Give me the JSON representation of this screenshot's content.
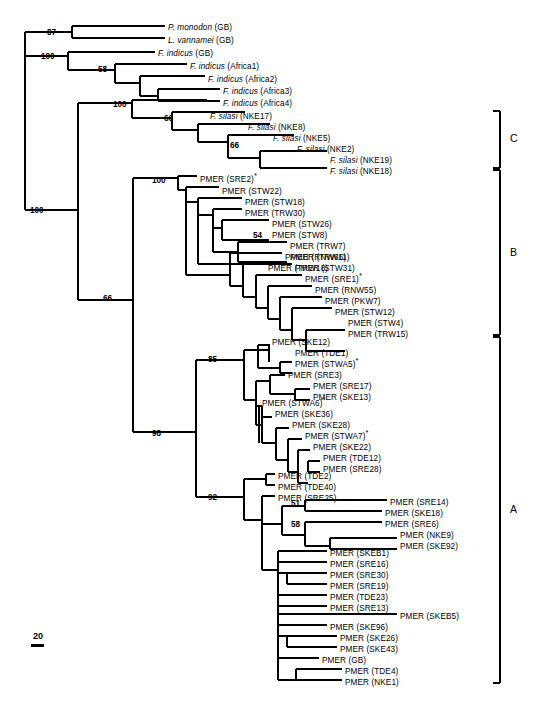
{
  "figure": {
    "kind": "phylogenetic-tree",
    "tree_type": "rectangular-cladogram",
    "scale_bar": {
      "value": "20"
    },
    "asterisk_marker": "*"
  },
  "clade_brackets": [
    {
      "id": "C",
      "label": "C",
      "y_top": 111,
      "y_bottom": 168
    },
    {
      "id": "B",
      "label": "B",
      "y_top": 170,
      "y_bottom": 335
    },
    {
      "id": "A",
      "label": "A",
      "y_top": 337,
      "y_bottom": 683
    }
  ],
  "bootstrap_values": [
    {
      "value": "87",
      "x": 47,
      "y": 29
    },
    {
      "value": "100",
      "x": 41,
      "y": 53
    },
    {
      "value": "58",
      "x": 98,
      "y": 66
    },
    {
      "value": "100",
      "x": 113,
      "y": 101
    },
    {
      "value": "66",
      "x": 164,
      "y": 115
    },
    {
      "value": "66",
      "x": 230,
      "y": 142
    },
    {
      "value": "100",
      "x": 152,
      "y": 177
    },
    {
      "value": "54",
      "x": 253,
      "y": 232
    },
    {
      "value": "100",
      "x": 30,
      "y": 207
    },
    {
      "value": "66",
      "x": 103,
      "y": 295
    },
    {
      "value": "98",
      "x": 152,
      "y": 430
    },
    {
      "value": "85",
      "x": 208,
      "y": 356
    },
    {
      "value": "92",
      "x": 208,
      "y": 494
    },
    {
      "value": "51",
      "x": 291,
      "y": 500
    },
    {
      "value": "58",
      "x": 291,
      "y": 521
    }
  ],
  "taxa": [
    {
      "name": "P. monodon (GB)",
      "genus": "P. monodon",
      "suffix": " (GB)",
      "italic": true,
      "asterisk": false,
      "x": 168,
      "y": 28,
      "tip_x": 165
    },
    {
      "name": "L. vannamei (GB)",
      "genus": "L. vannamei",
      "suffix": " (GB)",
      "italic": true,
      "asterisk": false,
      "x": 168,
      "y": 41,
      "tip_x": 165
    },
    {
      "name": "F. indicus (GB)",
      "genus": "F. indicus",
      "suffix": " (GB)",
      "italic": true,
      "asterisk": false,
      "x": 158,
      "y": 54,
      "tip_x": 155
    },
    {
      "name": "F. indicus (Africa1)",
      "genus": "F. indicus",
      "suffix": " (Africa1)",
      "italic": true,
      "asterisk": false,
      "x": 190,
      "y": 67,
      "tip_x": 187
    },
    {
      "name": "F. indicus (Africa2)",
      "genus": "F. indicus",
      "suffix": " (Africa2)",
      "italic": true,
      "asterisk": false,
      "x": 208,
      "y": 80,
      "tip_x": 205
    },
    {
      "name": "F. indicus (Africa3)",
      "genus": "F. indicus",
      "suffix": " (Africa3)",
      "italic": true,
      "asterisk": false,
      "x": 223,
      "y": 92,
      "tip_x": 220
    },
    {
      "name": "F. indicus (Africa4)",
      "genus": "F. indicus",
      "suffix": " (Africa4)",
      "italic": true,
      "asterisk": false,
      "x": 223,
      "y": 104,
      "tip_x": 220
    },
    {
      "name": "F. silasi (NKE17)",
      "genus": "F. silasi",
      "suffix": " (NKE17)",
      "italic": true,
      "asterisk": false,
      "x": 210,
      "y": 117,
      "tip_x": 207
    },
    {
      "name": "F. silasi (NKE8)",
      "genus": "F. silasi",
      "suffix": " (NKE8)",
      "italic": true,
      "asterisk": false,
      "x": 248,
      "y": 128,
      "tip_x": 245
    },
    {
      "name": "F. silasi (NKE5)",
      "genus": "F. silasi",
      "suffix": " (NKE5)",
      "italic": true,
      "asterisk": false,
      "x": 273,
      "y": 139,
      "tip_x": 270
    },
    {
      "name": "F. silasi (NKE2)",
      "genus": "F. silasi",
      "suffix": " (NKE2)",
      "italic": true,
      "asterisk": false,
      "x": 297,
      "y": 150,
      "tip_x": 294
    },
    {
      "name": "F. silasi (NKE19)",
      "genus": "F. silasi",
      "suffix": " (NKE19)",
      "italic": true,
      "asterisk": false,
      "x": 330,
      "y": 161,
      "tip_x": 327
    },
    {
      "name": "F. silasi (NKE18)",
      "genus": "F. silasi",
      "suffix": " (NKE18)",
      "italic": true,
      "asterisk": false,
      "x": 330,
      "y": 172,
      "tip_x": 327
    },
    {
      "name": "PMER (SRE2)*",
      "genus": "",
      "suffix": "PMER (SRE2)",
      "italic": false,
      "asterisk": true,
      "x": 200,
      "y": 180,
      "tip_x": 197
    },
    {
      "name": "PMER (STW22)",
      "genus": "",
      "suffix": "PMER (STW22)",
      "italic": false,
      "asterisk": false,
      "x": 222,
      "y": 192,
      "tip_x": 219
    },
    {
      "name": "PMER (STW18)",
      "genus": "",
      "suffix": "PMER (STW18)",
      "italic": false,
      "asterisk": false,
      "x": 245,
      "y": 203,
      "tip_x": 242
    },
    {
      "name": "PMER (TRW30)",
      "genus": "",
      "suffix": "PMER (TRW30)",
      "italic": false,
      "asterisk": false,
      "x": 245,
      "y": 214,
      "tip_x": 242
    },
    {
      "name": "PMER (STW26)",
      "genus": "",
      "suffix": "PMER (STW26)",
      "italic": false,
      "asterisk": false,
      "x": 272,
      "y": 225,
      "tip_x": 269
    },
    {
      "name": "PMER (STW8)",
      "genus": "",
      "suffix": "PMER (STW8)",
      "italic": false,
      "asterisk": false,
      "x": 272,
      "y": 236,
      "tip_x": 269
    },
    {
      "name": "PMER (TRW7)",
      "genus": "",
      "suffix": "PMER (TRW7)",
      "italic": false,
      "asterisk": false,
      "x": 290,
      "y": 247,
      "tip_x": 287
    },
    {
      "name": "PMER (TRW11)",
      "genus": "",
      "suffix": "PMER (TRW11)",
      "italic": false,
      "asterisk": false,
      "x": 290,
      "y": 258,
      "tip_x": 287
    },
    {
      "name": "PMER (TRW18)",
      "genus": "",
      "suffix": "PMER (TRW18)",
      "italic": false,
      "asterisk": false,
      "x": 268,
      "y": 269,
      "tip_x": 265
    },
    {
      "name": "PMER (RNW66)",
      "genus": "",
      "suffix": "PMER (RNW66)",
      "italic": false,
      "asterisk": false,
      "x": 285,
      "y": 258,
      "tip_x": 282
    },
    {
      "name": "PMER (STW31)",
      "genus": "",
      "suffix": "PMER (STW31)",
      "italic": false,
      "asterisk": false,
      "x": 295,
      "y": 269,
      "tip_x": 292
    },
    {
      "name": "PMER (SRE1)*",
      "genus": "",
      "suffix": "PMER (SRE1)",
      "italic": false,
      "asterisk": true,
      "x": 305,
      "y": 280,
      "tip_x": 302
    },
    {
      "name": "PMER (RNW55)",
      "genus": "",
      "suffix": "PMER (RNW55)",
      "italic": false,
      "asterisk": false,
      "x": 315,
      "y": 291,
      "tip_x": 312
    },
    {
      "name": "PMER (PKW7)",
      "genus": "",
      "suffix": "PMER (PKW7)",
      "italic": false,
      "asterisk": false,
      "x": 325,
      "y": 302,
      "tip_x": 322
    },
    {
      "name": "PMER (STW12)",
      "genus": "",
      "suffix": "PMER (STW12)",
      "italic": false,
      "asterisk": false,
      "x": 335,
      "y": 313,
      "tip_x": 332
    },
    {
      "name": "PMER (STW4)",
      "genus": "",
      "suffix": "PMER (STW4)",
      "italic": false,
      "asterisk": false,
      "x": 348,
      "y": 324,
      "tip_x": 345
    },
    {
      "name": "PMER (TRW15)",
      "genus": "",
      "suffix": "PMER (TRW15)",
      "italic": false,
      "asterisk": false,
      "x": 348,
      "y": 335,
      "tip_x": 345
    },
    {
      "name": "PMER (SKE12)",
      "genus": "",
      "suffix": "PMER (SKE12)",
      "italic": false,
      "asterisk": false,
      "x": 272,
      "y": 343,
      "tip_x": 269
    },
    {
      "name": "PMER (TDE1)",
      "genus": "",
      "suffix": "PMER (TDE1)",
      "italic": false,
      "asterisk": false,
      "x": 295,
      "y": 354,
      "tip_x": 292
    },
    {
      "name": "PMER (STWA5)*",
      "genus": "",
      "suffix": "PMER (STWA5)",
      "italic": false,
      "asterisk": true,
      "x": 295,
      "y": 365,
      "tip_x": 292
    },
    {
      "name": "PMER (SRE3)",
      "genus": "",
      "suffix": "PMER (SRE3)",
      "italic": false,
      "asterisk": false,
      "x": 288,
      "y": 376,
      "tip_x": 285
    },
    {
      "name": "PMER (SRE17)",
      "genus": "",
      "suffix": "PMER (SRE17)",
      "italic": false,
      "asterisk": false,
      "x": 313,
      "y": 387,
      "tip_x": 310
    },
    {
      "name": "PMER (SKE13)",
      "genus": "",
      "suffix": "PMER (SKE13)",
      "italic": false,
      "asterisk": false,
      "x": 313,
      "y": 398,
      "tip_x": 310
    },
    {
      "name": "PMER (STWA6)*",
      "genus": "",
      "suffix": "PMER (STWA6)",
      "italic": false,
      "asterisk": true,
      "x": 262,
      "y": 404,
      "tip_x": 259
    },
    {
      "name": "PMER (SKE36)",
      "genus": "",
      "suffix": "PMER (SKE36)",
      "italic": false,
      "asterisk": false,
      "x": 275,
      "y": 415,
      "tip_x": 272
    },
    {
      "name": "PMER (SKE28)",
      "genus": "",
      "suffix": "PMER (SKE28)",
      "italic": false,
      "asterisk": false,
      "x": 292,
      "y": 426,
      "tip_x": 289
    },
    {
      "name": "PMER (STWA7)*",
      "genus": "",
      "suffix": "PMER (STWA7)",
      "italic": false,
      "asterisk": true,
      "x": 305,
      "y": 437,
      "tip_x": 302
    },
    {
      "name": "PMER (SKE22)",
      "genus": "",
      "suffix": "PMER (SKE22)",
      "italic": false,
      "asterisk": false,
      "x": 313,
      "y": 448,
      "tip_x": 310
    },
    {
      "name": "PMER (TDE12)",
      "genus": "",
      "suffix": "PMER (TDE12)",
      "italic": false,
      "asterisk": false,
      "x": 323,
      "y": 459,
      "tip_x": 320
    },
    {
      "name": "PMER (SRE28)",
      "genus": "",
      "suffix": "PMER (SRE28)",
      "italic": false,
      "asterisk": false,
      "x": 323,
      "y": 470,
      "tip_x": 320
    },
    {
      "name": "PMER (TDE2)",
      "genus": "",
      "suffix": "PMER (TDE2)",
      "italic": false,
      "asterisk": false,
      "x": 278,
      "y": 477,
      "tip_x": 275
    },
    {
      "name": "PMER (TDE40)",
      "genus": "",
      "suffix": "PMER (TDE40)",
      "italic": false,
      "asterisk": false,
      "x": 278,
      "y": 488,
      "tip_x": 275
    },
    {
      "name": "PMER (SRE25)",
      "genus": "",
      "suffix": "PMER (SRE25)",
      "italic": false,
      "asterisk": false,
      "x": 278,
      "y": 499,
      "tip_x": 275
    },
    {
      "name": "PMER (SRE14)",
      "genus": "",
      "suffix": "PMER (SRE14)",
      "italic": false,
      "asterisk": false,
      "x": 390,
      "y": 503,
      "tip_x": 387
    },
    {
      "name": "PMER (SKE18)",
      "genus": "",
      "suffix": "PMER (SKE18)",
      "italic": false,
      "asterisk": false,
      "x": 385,
      "y": 514,
      "tip_x": 382
    },
    {
      "name": "PMER (SRE6)",
      "genus": "",
      "suffix": "PMER (SRE6)",
      "italic": false,
      "asterisk": false,
      "x": 385,
      "y": 525,
      "tip_x": 382
    },
    {
      "name": "PMER (NKE9)",
      "genus": "",
      "suffix": "PMER (NKE9)",
      "italic": false,
      "asterisk": false,
      "x": 400,
      "y": 536,
      "tip_x": 397
    },
    {
      "name": "PMER (SKE92)",
      "genus": "",
      "suffix": "PMER (SKE92)",
      "italic": false,
      "asterisk": false,
      "x": 400,
      "y": 547,
      "tip_x": 397
    },
    {
      "name": "PMER (SKEB1)",
      "genus": "",
      "suffix": "PMER (SKEB1)",
      "italic": false,
      "asterisk": false,
      "x": 330,
      "y": 554,
      "tip_x": 327
    },
    {
      "name": "PMER (SRE16)",
      "genus": "",
      "suffix": "PMER (SRE16)",
      "italic": false,
      "asterisk": false,
      "x": 330,
      "y": 565,
      "tip_x": 327
    },
    {
      "name": "PMER (SRE30)",
      "genus": "",
      "suffix": "PMER (SRE30)",
      "italic": false,
      "asterisk": false,
      "x": 330,
      "y": 576,
      "tip_x": 327
    },
    {
      "name": "PMER (SRE19)",
      "genus": "",
      "suffix": "PMER (SRE19)",
      "italic": false,
      "asterisk": false,
      "x": 330,
      "y": 587,
      "tip_x": 327
    },
    {
      "name": "PMER (TDE23)",
      "genus": "",
      "suffix": "PMER (TDE23)",
      "italic": false,
      "asterisk": false,
      "x": 330,
      "y": 598,
      "tip_x": 327
    },
    {
      "name": "PMER (SRE13)",
      "genus": "",
      "suffix": "PMER (SRE13)",
      "italic": false,
      "asterisk": false,
      "x": 330,
      "y": 609,
      "tip_x": 327
    },
    {
      "name": "PMER (SKEB5)",
      "genus": "",
      "suffix": "PMER (SKEB5)",
      "italic": false,
      "asterisk": false,
      "x": 400,
      "y": 617,
      "tip_x": 397
    },
    {
      "name": "PMER (SKE96)",
      "genus": "",
      "suffix": "PMER (SKE96)",
      "italic": false,
      "asterisk": false,
      "x": 330,
      "y": 628,
      "tip_x": 327
    },
    {
      "name": "PMER (SKE26)",
      "genus": "",
      "suffix": "PMER (SKE26)",
      "italic": false,
      "asterisk": false,
      "x": 340,
      "y": 639,
      "tip_x": 337
    },
    {
      "name": "PMER (SKE43)",
      "genus": "",
      "suffix": "PMER (SKE43)",
      "italic": false,
      "asterisk": false,
      "x": 340,
      "y": 650,
      "tip_x": 337
    },
    {
      "name": "PMER (GB)",
      "genus": "",
      "suffix": "PMER (GB)",
      "italic": false,
      "asterisk": false,
      "x": 322,
      "y": 661,
      "tip_x": 319
    },
    {
      "name": "PMER (TDE4)",
      "genus": "",
      "suffix": "PMER (TDE4)",
      "italic": false,
      "asterisk": false,
      "x": 345,
      "y": 672,
      "tip_x": 342
    },
    {
      "name": "PMER (NKE1)",
      "genus": "",
      "suffix": "PMER (NKE1)",
      "italic": false,
      "asterisk": false,
      "x": 345,
      "y": 683,
      "tip_x": 342
    }
  ]
}
